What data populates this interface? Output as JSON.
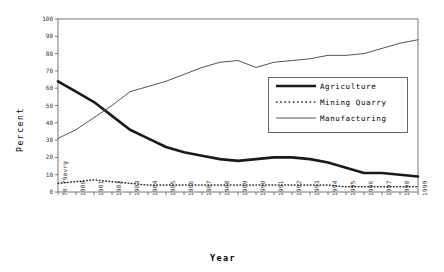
{
  "chart_data": {
    "type": "line",
    "title": "",
    "xlabel": "Year",
    "ylabel": "Percent",
    "ylim": [
      0,
      100
    ],
    "yticks": [
      0,
      10,
      20,
      30,
      40,
      50,
      60,
      70,
      80,
      90,
      100
    ],
    "grid": false,
    "legend_position": "center-right",
    "categories": [
      "70-79avrg",
      "1980",
      "1981",
      "1982",
      "1983",
      "1984",
      "1985",
      "1986",
      "1987",
      "1988",
      "1989",
      "1990",
      "1991",
      "1992",
      "1993",
      "1994",
      "1995",
      "1996",
      "1997",
      "1998",
      "1999"
    ],
    "series": [
      {
        "name": "Agriculture",
        "style": "thick-solid",
        "color": "#1a1a1a",
        "values": [
          64,
          58,
          52,
          44,
          36,
          31,
          26,
          23,
          21,
          19,
          18,
          19,
          20,
          20,
          19,
          17,
          14,
          11,
          11,
          10,
          9
        ]
      },
      {
        "name": "Mining Quarry",
        "style": "dotted",
        "color": "#2b2b2b",
        "values": [
          5,
          6,
          7,
          6,
          5,
          4,
          4,
          4,
          4,
          4,
          4,
          4,
          4,
          4,
          4,
          4,
          3,
          3,
          3,
          3,
          3
        ]
      },
      {
        "name": "Manufacturing",
        "style": "thin-solid",
        "color": "#555555",
        "values": [
          31,
          36,
          43,
          50,
          58,
          61,
          64,
          68,
          72,
          75,
          76,
          72,
          75,
          76,
          77,
          79,
          79,
          80,
          83,
          86,
          88
        ]
      }
    ]
  },
  "axis": {
    "y_title": "Percent",
    "x_title": "Year"
  },
  "legend": {
    "entries": [
      {
        "label": "Agriculture"
      },
      {
        "label": "Mining Quarry"
      },
      {
        "label": "Manufacturing"
      }
    ]
  }
}
